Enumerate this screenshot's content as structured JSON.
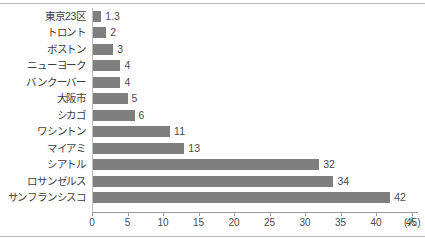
{
  "chart_data": {
    "type": "bar",
    "orientation": "horizontal",
    "title": "",
    "xlabel": "(人)",
    "ylabel": "",
    "categories": [
      "東京23区",
      "トロント",
      "ボストン",
      "ニューヨーク",
      "バンクーバー",
      "大阪市",
      "シカゴ",
      "ワシントン",
      "マイアミ",
      "シアトル",
      "ロサンゼルス",
      "サンフランシスコ"
    ],
    "values": [
      1.3,
      2,
      3,
      4,
      4,
      5,
      6,
      11,
      13,
      32,
      34,
      42
    ],
    "value_labels": [
      "1.3",
      "2",
      "3",
      "4",
      "4",
      "5",
      "6",
      "11",
      "13",
      "32",
      "34",
      "42"
    ],
    "xlim": [
      0,
      46
    ],
    "xticks": [
      0,
      5,
      10,
      15,
      20,
      25,
      30,
      35,
      40,
      45
    ],
    "xtick_labels": [
      "0",
      "5",
      "10",
      "15",
      "20",
      "25",
      "30",
      "35",
      "40",
      "45"
    ],
    "grid": false,
    "legend": null,
    "bar_color": "#7f7f7f",
    "axis_color": "#9a9a9a",
    "text_color": "#3c3c3c",
    "unit_suffix": "(人)"
  }
}
